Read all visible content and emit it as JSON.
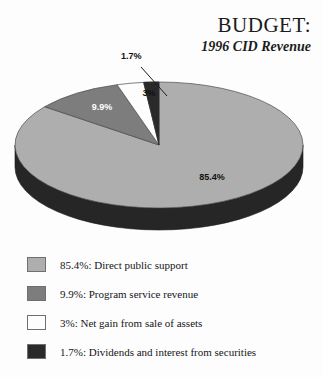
{
  "header": {
    "title": "BUDGET:",
    "subtitle": "1996 CID Revenue"
  },
  "chart_data": {
    "type": "pie",
    "title": "BUDGET:",
    "subtitle": "1996 CID Revenue",
    "xlabel": "",
    "ylabel": "",
    "grid": false,
    "legend_position": "bottom",
    "three_d": true,
    "categories": [
      "Direct public support",
      "Program service revenue",
      "Net gain from sale of assets",
      "Dividends and interest from securities"
    ],
    "values": [
      85.4,
      9.9,
      3.0,
      1.7
    ],
    "value_labels": [
      "85.4%",
      "9.9%",
      "3%",
      "1.7%"
    ],
    "colors": [
      "#aeaeae",
      "#7d7d7d",
      "#fdfdfd",
      "#2a2a2a"
    ],
    "slices": [
      {
        "label": "85.4%",
        "value": 85.4,
        "name": "Direct public support",
        "color": "#aeaeae",
        "callout": false
      },
      {
        "label": "9.9%",
        "value": 9.9,
        "name": "Program service revenue",
        "color": "#7d7d7d",
        "callout": false
      },
      {
        "label": "3%",
        "value": 3.0,
        "name": "Net gain from sale of assets",
        "color": "#fdfdfd",
        "callout": false
      },
      {
        "label": "1.7%",
        "value": 1.7,
        "name": "Dividends and interest from securities",
        "color": "#2a2a2a",
        "callout": true
      }
    ]
  },
  "legend": {
    "items": [
      {
        "text": "85.4%:  Direct public support",
        "color": "#aeaeae"
      },
      {
        "text": "9.9%:  Program service revenue",
        "color": "#7d7d7d"
      },
      {
        "text": "3%:  Net gain from sale of assets",
        "color": "#fdfdfd"
      },
      {
        "text": "1.7%:  Dividends and interest from securities",
        "color": "#2a2a2a"
      }
    ]
  }
}
